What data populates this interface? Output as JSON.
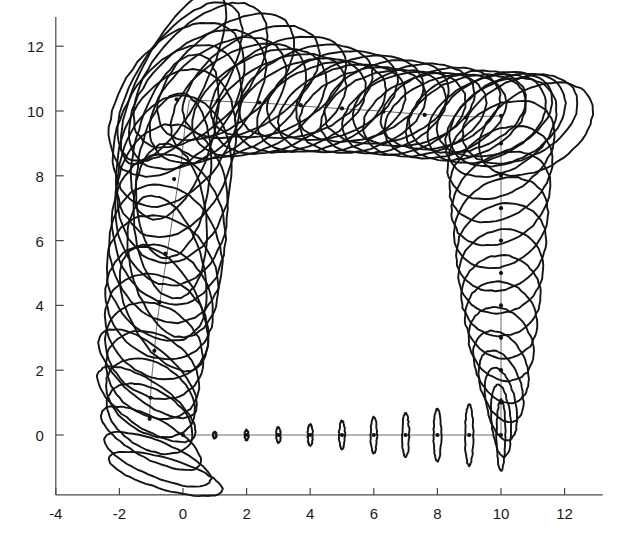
{
  "figure": {
    "kind": "uncertainty-ellipse-trajectory-plot",
    "title": "",
    "background": "#ffffff",
    "ink_color": "#141414",
    "axis_color": "#4a4a4a",
    "path_color": "#6d6d6d"
  },
  "axes": {
    "x_ticks": [
      -4,
      -2,
      0,
      2,
      4,
      6,
      8,
      10,
      12
    ],
    "x_tick_labels": [
      "-4",
      "-2",
      "0",
      "2",
      "4",
      "6",
      "8",
      "10",
      "12"
    ],
    "y_ticks": [
      0,
      2,
      4,
      6,
      8,
      10,
      12
    ],
    "y_tick_labels": [
      "0",
      "2",
      "4",
      "6",
      "8",
      "10",
      "12"
    ],
    "xlim": [
      -4.6,
      13.2
    ],
    "ylim": [
      -1.9,
      12.9
    ],
    "xlabel": "",
    "ylabel": "",
    "grid": false,
    "x_axis_y_value": -1.85,
    "y_axis_x_value": -4.0
  },
  "chart_data": {
    "type": "scatter",
    "title": "",
    "xlabel": "",
    "ylabel": "",
    "xlim": [
      -4.6,
      13.2
    ],
    "ylim": [
      -1.9,
      12.9
    ],
    "grid": false,
    "legend": [],
    "series": [
      {
        "name": "estimated-trajectory",
        "style": "polyline-with-dots",
        "x": [
          0.0,
          1.0,
          2.0,
          3.0,
          4.0,
          5.0,
          6.0,
          7.0,
          8.0,
          9.0,
          10.0,
          10.0,
          10.0,
          10.0,
          10.0,
          10.0,
          10.0,
          10.0,
          10.0,
          10.0,
          10.0,
          9.1,
          8.2,
          7.2,
          6.2,
          5.2,
          4.2,
          3.2,
          2.2,
          1.2,
          0.2,
          0.05,
          -0.05,
          -0.2,
          -0.35,
          -0.5,
          -0.65,
          -0.8,
          -0.9,
          -1.0,
          -1.05
        ],
        "y": [
          0.0,
          0.0,
          0.0,
          0.0,
          0.0,
          0.0,
          0.0,
          0.0,
          0.0,
          0.0,
          0.0,
          1.0,
          2.0,
          3.0,
          4.0,
          5.0,
          6.0,
          7.0,
          8.0,
          9.0,
          9.85,
          9.82,
          9.86,
          9.92,
          10.0,
          10.06,
          10.12,
          10.2,
          10.26,
          10.3,
          10.34,
          9.4,
          8.45,
          7.5,
          6.55,
          5.6,
          4.6,
          3.6,
          2.6,
          1.6,
          0.6
        ]
      },
      {
        "name": "covariance-ellipses",
        "style": "ellipse-outline",
        "note": "one 2-sigma covariance ellipse per pose; semi-axes in plot units, angle in degrees CCW",
        "ellipses": [
          {
            "cx": 1.0,
            "cy": 0.0,
            "rx": 0.05,
            "ry": 0.1,
            "angle": 0
          },
          {
            "cx": 2.0,
            "cy": 0.0,
            "rx": 0.06,
            "ry": 0.16,
            "angle": 0
          },
          {
            "cx": 3.0,
            "cy": 0.0,
            "rx": 0.07,
            "ry": 0.24,
            "angle": 0
          },
          {
            "cx": 4.0,
            "cy": 0.0,
            "rx": 0.08,
            "ry": 0.33,
            "angle": 0
          },
          {
            "cx": 5.0,
            "cy": 0.0,
            "rx": 0.09,
            "ry": 0.44,
            "angle": 0
          },
          {
            "cx": 6.0,
            "cy": 0.0,
            "rx": 0.1,
            "ry": 0.56,
            "angle": 0
          },
          {
            "cx": 7.0,
            "cy": 0.0,
            "rx": 0.11,
            "ry": 0.68,
            "angle": 0
          },
          {
            "cx": 8.0,
            "cy": 0.0,
            "rx": 0.12,
            "ry": 0.82,
            "angle": 0
          },
          {
            "cx": 9.0,
            "cy": 0.0,
            "rx": 0.13,
            "ry": 0.95,
            "angle": 0
          },
          {
            "cx": 10.0,
            "cy": 0.0,
            "rx": 0.14,
            "ry": 1.1,
            "angle": 0
          },
          {
            "cx": 10.0,
            "cy": 0.45,
            "rx": 0.3,
            "ry": 1.12,
            "angle": 5
          },
          {
            "cx": 10.0,
            "cy": 0.95,
            "rx": 0.46,
            "ry": 1.14,
            "angle": 12
          },
          {
            "cx": 10.0,
            "cy": 1.5,
            "rx": 0.62,
            "ry": 1.16,
            "angle": 20
          },
          {
            "cx": 10.0,
            "cy": 2.1,
            "rx": 0.78,
            "ry": 1.18,
            "angle": 26
          },
          {
            "cx": 10.0,
            "cy": 2.8,
            "rx": 0.95,
            "ry": 1.2,
            "angle": 31
          },
          {
            "cx": 10.0,
            "cy": 3.55,
            "rx": 1.1,
            "ry": 1.22,
            "angle": 34
          },
          {
            "cx": 10.0,
            "cy": 4.3,
            "rx": 1.25,
            "ry": 1.24,
            "angle": 36
          },
          {
            "cx": 10.0,
            "cy": 5.05,
            "rx": 1.38,
            "ry": 1.25,
            "angle": 37
          },
          {
            "cx": 10.0,
            "cy": 5.8,
            "rx": 1.5,
            "ry": 1.26,
            "angle": 38
          },
          {
            "cx": 10.0,
            "cy": 6.55,
            "rx": 1.6,
            "ry": 1.27,
            "angle": 38
          },
          {
            "cx": 10.0,
            "cy": 7.3,
            "rx": 1.7,
            "ry": 1.28,
            "angle": 38
          },
          {
            "cx": 10.0,
            "cy": 8.05,
            "rx": 1.78,
            "ry": 1.29,
            "angle": 37
          },
          {
            "cx": 10.0,
            "cy": 8.8,
            "rx": 1.86,
            "ry": 1.3,
            "angle": 36
          },
          {
            "cx": 10.0,
            "cy": 9.5,
            "rx": 1.92,
            "ry": 1.31,
            "angle": 34
          },
          {
            "cx": 10.2,
            "cy": 9.72,
            "rx": 1.95,
            "ry": 1.25,
            "angle": 28
          },
          {
            "cx": 9.55,
            "cy": 9.76,
            "rx": 1.96,
            "ry": 1.22,
            "angle": 24
          },
          {
            "cx": 8.9,
            "cy": 9.8,
            "rx": 1.97,
            "ry": 1.2,
            "angle": 21
          },
          {
            "cx": 8.25,
            "cy": 9.84,
            "rx": 1.98,
            "ry": 1.19,
            "angle": 19
          },
          {
            "cx": 7.6,
            "cy": 9.88,
            "rx": 1.99,
            "ry": 1.19,
            "angle": 18
          },
          {
            "cx": 6.95,
            "cy": 9.93,
            "rx": 2.0,
            "ry": 1.19,
            "angle": 17
          },
          {
            "cx": 6.3,
            "cy": 9.98,
            "rx": 2.02,
            "ry": 1.2,
            "angle": 17
          },
          {
            "cx": 5.65,
            "cy": 10.03,
            "rx": 2.05,
            "ry": 1.21,
            "angle": 18
          },
          {
            "cx": 5.0,
            "cy": 10.08,
            "rx": 2.08,
            "ry": 1.23,
            "angle": 19
          },
          {
            "cx": 4.35,
            "cy": 10.13,
            "rx": 2.12,
            "ry": 1.25,
            "angle": 21
          },
          {
            "cx": 3.7,
            "cy": 10.18,
            "rx": 2.17,
            "ry": 1.28,
            "angle": 23
          },
          {
            "cx": 3.05,
            "cy": 10.22,
            "rx": 2.23,
            "ry": 1.32,
            "angle": 26
          },
          {
            "cx": 2.4,
            "cy": 10.26,
            "rx": 2.3,
            "ry": 1.37,
            "angle": 30
          },
          {
            "cx": 1.75,
            "cy": 10.3,
            "rx": 2.38,
            "ry": 1.43,
            "angle": 34
          },
          {
            "cx": 1.1,
            "cy": 10.33,
            "rx": 2.48,
            "ry": 1.5,
            "angle": 39
          },
          {
            "cx": 0.45,
            "cy": 10.35,
            "rx": 2.6,
            "ry": 1.58,
            "angle": 45
          },
          {
            "cx": -0.2,
            "cy": 10.36,
            "rx": 2.72,
            "ry": 1.66,
            "angle": 52
          },
          {
            "cx": -0.18,
            "cy": 9.55,
            "rx": 2.72,
            "ry": 1.72,
            "angle": 60
          },
          {
            "cx": -0.22,
            "cy": 8.7,
            "rx": 2.68,
            "ry": 1.76,
            "angle": 70
          },
          {
            "cx": -0.28,
            "cy": 7.9,
            "rx": 2.6,
            "ry": 1.78,
            "angle": 80
          },
          {
            "cx": -0.36,
            "cy": 7.1,
            "rx": 2.48,
            "ry": 1.78,
            "angle": 90
          },
          {
            "cx": -0.45,
            "cy": 6.35,
            "rx": 2.34,
            "ry": 1.76,
            "angle": 100
          },
          {
            "cx": -0.55,
            "cy": 5.6,
            "rx": 2.18,
            "ry": 1.72,
            "angle": 110
          },
          {
            "cx": -0.65,
            "cy": 4.85,
            "rx": 2.02,
            "ry": 1.66,
            "angle": 120
          },
          {
            "cx": -0.74,
            "cy": 4.1,
            "rx": 1.88,
            "ry": 1.58,
            "angle": 128
          },
          {
            "cx": -0.82,
            "cy": 3.35,
            "rx": 1.76,
            "ry": 1.48,
            "angle": 135
          },
          {
            "cx": -0.9,
            "cy": 2.6,
            "rx": 1.66,
            "ry": 1.36,
            "angle": 140
          },
          {
            "cx": -0.96,
            "cy": 1.85,
            "rx": 1.58,
            "ry": 1.22,
            "angle": 144
          },
          {
            "cx": -1.02,
            "cy": 1.15,
            "rx": 1.52,
            "ry": 1.06,
            "angle": 147
          },
          {
            "cx": -1.05,
            "cy": 0.5,
            "rx": 1.48,
            "ry": 0.9,
            "angle": 149
          },
          {
            "cx": -0.3,
            "cy": 11.05,
            "rx": 3.0,
            "ry": 1.0,
            "angle": 62
          },
          {
            "cx": -0.1,
            "cy": 10.9,
            "rx": 2.85,
            "ry": 1.3,
            "angle": 55
          },
          {
            "cx": 0.55,
            "cy": 11.1,
            "rx": 2.7,
            "ry": 1.45,
            "angle": 48
          },
          {
            "cx": 1.35,
            "cy": 11.05,
            "rx": 2.55,
            "ry": 1.4,
            "angle": 40
          },
          {
            "cx": 2.15,
            "cy": 10.9,
            "rx": 2.4,
            "ry": 1.35,
            "angle": 33
          },
          {
            "cx": 3.0,
            "cy": 10.75,
            "rx": 2.3,
            "ry": 1.3,
            "angle": 27
          },
          {
            "cx": 3.85,
            "cy": 10.6,
            "rx": 2.2,
            "ry": 1.28,
            "angle": 22
          },
          {
            "cx": 4.7,
            "cy": 10.48,
            "rx": 2.12,
            "ry": 1.26,
            "angle": 19
          },
          {
            "cx": 5.55,
            "cy": 10.38,
            "rx": 2.06,
            "ry": 1.24,
            "angle": 17
          },
          {
            "cx": 6.4,
            "cy": 10.28,
            "rx": 2.0,
            "ry": 1.22,
            "angle": 16
          },
          {
            "cx": 7.25,
            "cy": 10.18,
            "rx": 1.96,
            "ry": 1.2,
            "angle": 16
          },
          {
            "cx": 8.1,
            "cy": 10.08,
            "rx": 1.92,
            "ry": 1.18,
            "angle": 17
          },
          {
            "cx": 8.95,
            "cy": 9.98,
            "rx": 1.9,
            "ry": 1.17,
            "angle": 19
          },
          {
            "cx": 9.8,
            "cy": 9.9,
            "rx": 1.9,
            "ry": 1.18,
            "angle": 22
          },
          {
            "cx": 10.6,
            "cy": 9.75,
            "rx": 1.92,
            "ry": 1.2,
            "angle": 26
          },
          {
            "cx": 11.1,
            "cy": 9.45,
            "rx": 1.94,
            "ry": 1.22,
            "angle": 30
          },
          {
            "cx": -0.6,
            "cy": 3.9,
            "rx": 2.1,
            "ry": 1.1,
            "angle": 118
          },
          {
            "cx": -0.5,
            "cy": 5.2,
            "rx": 2.25,
            "ry": 1.12,
            "angle": 106
          },
          {
            "cx": -0.4,
            "cy": 6.6,
            "rx": 2.4,
            "ry": 1.14,
            "angle": 95
          },
          {
            "cx": -0.3,
            "cy": 8.0,
            "rx": 2.55,
            "ry": 1.15,
            "angle": 84
          },
          {
            "cx": -0.25,
            "cy": 9.2,
            "rx": 2.66,
            "ry": 1.16,
            "angle": 72
          },
          {
            "cx": -1.1,
            "cy": 1.9,
            "rx": 1.9,
            "ry": 0.8,
            "angle": 140
          },
          {
            "cx": -1.15,
            "cy": 0.95,
            "rx": 1.8,
            "ry": 0.7,
            "angle": 146
          },
          {
            "cx": -1.0,
            "cy": -0.1,
            "rx": 1.75,
            "ry": 0.62,
            "angle": 152
          },
          {
            "cx": -0.8,
            "cy": -0.75,
            "rx": 1.8,
            "ry": 0.55,
            "angle": 158
          },
          {
            "cx": -0.55,
            "cy": -1.2,
            "rx": 1.85,
            "ry": 0.48,
            "angle": 164
          }
        ]
      }
    ]
  },
  "waypoint_dots": {
    "name": "pose-markers",
    "points": [
      {
        "x": 0.0,
        "y": 0.0
      },
      {
        "x": 2.0,
        "y": 0.0
      },
      {
        "x": 3.0,
        "y": 0.0
      },
      {
        "x": 4.0,
        "y": 0.0
      },
      {
        "x": 5.0,
        "y": 0.0
      },
      {
        "x": 6.0,
        "y": 0.0
      },
      {
        "x": 7.0,
        "y": 0.0
      },
      {
        "x": 8.0,
        "y": 0.0
      },
      {
        "x": 9.0,
        "y": 0.0
      },
      {
        "x": 10.0,
        "y": 0.0
      },
      {
        "x": 10.0,
        "y": 1.0
      },
      {
        "x": 10.0,
        "y": 2.0
      },
      {
        "x": 10.0,
        "y": 3.0
      },
      {
        "x": 10.0,
        "y": 4.0
      },
      {
        "x": 10.0,
        "y": 5.0
      },
      {
        "x": 10.0,
        "y": 6.0
      },
      {
        "x": 10.0,
        "y": 7.0
      },
      {
        "x": 10.0,
        "y": 8.0
      },
      {
        "x": 10.0,
        "y": 9.0
      },
      {
        "x": 10.0,
        "y": 9.85
      },
      {
        "x": 8.9,
        "y": 9.8
      },
      {
        "x": 7.6,
        "y": 9.88
      },
      {
        "x": 6.3,
        "y": 9.98
      },
      {
        "x": 5.0,
        "y": 10.08
      },
      {
        "x": 3.7,
        "y": 10.18
      },
      {
        "x": 2.4,
        "y": 10.26
      },
      {
        "x": 1.1,
        "y": 10.33
      },
      {
        "x": -0.2,
        "y": 10.36
      },
      {
        "x": -0.28,
        "y": 7.9
      },
      {
        "x": -0.55,
        "y": 5.6
      },
      {
        "x": -0.74,
        "y": 4.1
      },
      {
        "x": -0.9,
        "y": 2.6
      },
      {
        "x": -1.02,
        "y": 1.15
      },
      {
        "x": -1.05,
        "y": 0.5
      }
    ]
  }
}
